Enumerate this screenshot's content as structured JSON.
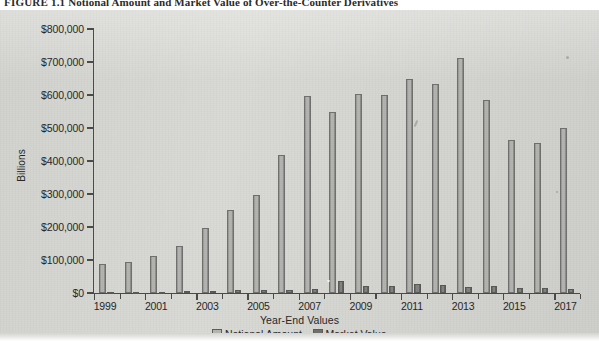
{
  "figure": {
    "number": "FIGURE 1.1",
    "caption": "Notional Amount and Market Value of Over-the-Counter Derivatives"
  },
  "legend": {
    "notional_label": "Notional Amount",
    "market_label": "Market Value"
  },
  "colors": {
    "notional": "#b3b3b0",
    "market": "#6f6f6d",
    "axis": "#4a4a48",
    "panel_background": "#d9d9d5",
    "text": "#262626"
  },
  "chart_data": {
    "type": "bar",
    "title": "Notional Amount and Market Value of Over-the-Counter Derivatives",
    "xlabel": "Year-End Values",
    "ylabel": "Billions",
    "ylim": [
      0,
      800000
    ],
    "ytick_values": [
      0,
      100000,
      200000,
      300000,
      400000,
      500000,
      600000,
      700000,
      800000
    ],
    "ytick_labels": [
      "$0",
      "$100,000",
      "$200,000",
      "$300,000",
      "$400,000",
      "$500,000",
      "$600,000",
      "$700,000",
      "$800,000"
    ],
    "grid": false,
    "legend_position": "bottom",
    "categories": [
      1999,
      2000,
      2001,
      2002,
      2003,
      2004,
      2005,
      2006,
      2007,
      2008,
      2009,
      2010,
      2011,
      2012,
      2013,
      2014,
      2015,
      2016,
      2017
    ],
    "xtick_labels": [
      "1999",
      "2001",
      "2003",
      "2005",
      "2007",
      "2009",
      "2011",
      "2013",
      "2015",
      "2017"
    ],
    "xtick_label_years": [
      1999,
      2001,
      2003,
      2005,
      2007,
      2009,
      2011,
      2013,
      2015,
      2017
    ],
    "series": [
      {
        "name": "Notional Amount",
        "color": "#b3b3b0",
        "values": [
          88000,
          95000,
          111000,
          142000,
          197000,
          251000,
          298000,
          418000,
          596000,
          548000,
          604000,
          601000,
          648000,
          633000,
          711000,
          586000,
          463000,
          456000,
          500000
        ]
      },
      {
        "name": "Market Value",
        "color": "#6f6f6d",
        "values": [
          2800,
          3200,
          3800,
          6400,
          7000,
          9400,
          9700,
          10000,
          11100,
          35300,
          21600,
          21300,
          27300,
          24700,
          18800,
          20900,
          14500,
          14900,
          11000
        ]
      }
    ]
  }
}
